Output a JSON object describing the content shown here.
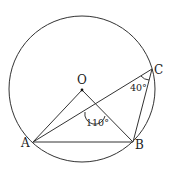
{
  "diagram": {
    "type": "circle-geometry",
    "circle": {
      "center": "O",
      "cx": 82,
      "cy": 89,
      "r": 73
    },
    "points": {
      "O": {
        "label": "O",
        "x": 82,
        "y": 90,
        "label_x": 77,
        "label_y": 84
      },
      "A": {
        "label": "A",
        "x": 33,
        "y": 142,
        "label_x": 21,
        "label_y": 147
      },
      "B": {
        "label": "B",
        "x": 133,
        "y": 142,
        "label_x": 135,
        "label_y": 149
      },
      "C": {
        "label": "C",
        "x": 152,
        "y": 69,
        "label_x": 154,
        "label_y": 74
      }
    },
    "segments": [
      [
        "O",
        "A"
      ],
      [
        "O",
        "B"
      ],
      [
        "A",
        "B"
      ],
      [
        "A",
        "C"
      ],
      [
        "B",
        "C"
      ]
    ],
    "angles": [
      {
        "label": "110°",
        "at": "intersection of OB and AC",
        "label_x": 86,
        "label_y": 126
      },
      {
        "label": "40°",
        "at": "C",
        "label_x": 130,
        "label_y": 91
      }
    ]
  }
}
